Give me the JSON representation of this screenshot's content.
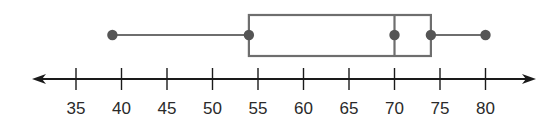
{
  "chart_data": {
    "type": "boxplot",
    "title": "",
    "xlabel": "",
    "ylabel": "",
    "orientation": "horizontal",
    "xlim": [
      32,
      87
    ],
    "x_ticks": [
      35,
      40,
      45,
      50,
      55,
      60,
      65,
      70,
      75,
      80
    ],
    "tick_labels": [
      "35",
      "40",
      "45",
      "50",
      "55",
      "60",
      "65",
      "70",
      "75",
      "80"
    ],
    "axis_arrows": "both",
    "grid": false,
    "five_number_summary": {
      "min": 39,
      "q1": 54,
      "median": 70,
      "q3": 74,
      "max": 80
    },
    "points_marked": [
      39,
      54,
      70,
      74,
      80
    ]
  },
  "colors": {
    "box_stroke": "#6e6e6e",
    "whisker": "#6e6e6e",
    "points": "#555555",
    "axis": "#1a1a1a"
  },
  "layout": {
    "px_origin_value": 35,
    "px_origin_x": 76,
    "px_per_unit": 9.1,
    "axis_y": 79,
    "box_top": 15,
    "box_bottom": 56,
    "whisker_y": 35,
    "axis_left": 32,
    "axis_right": 536
  }
}
